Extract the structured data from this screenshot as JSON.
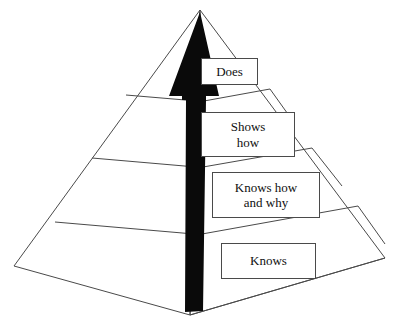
{
  "diagram": {
    "name": "millers-pyramid-of-clinical-competence",
    "type": "pyramid",
    "background_color": "#ffffff",
    "line_color": "#4a4a4a",
    "arrow_color": "#0a0a0a",
    "text_color": "#101010",
    "geometry": {
      "apex": [
        200,
        10
      ],
      "left_corner": [
        14,
        266
      ],
      "right_corner": [
        385,
        258
      ],
      "front_corner": [
        190,
        315
      ]
    },
    "arrow": {
      "name": "upward-progression-arrow",
      "direction": "up",
      "tip": [
        200,
        12
      ],
      "base": [
        197,
        312
      ]
    },
    "levels": [
      {
        "id": "does",
        "label": "Does",
        "tier": 1
      },
      {
        "id": "shows-how",
        "label": "Shows\nhow",
        "tier": 2
      },
      {
        "id": "knows-how-and-why",
        "label": "Knows how\nand why",
        "tier": 3
      },
      {
        "id": "knows",
        "label": "Knows",
        "tier": 4
      }
    ]
  }
}
